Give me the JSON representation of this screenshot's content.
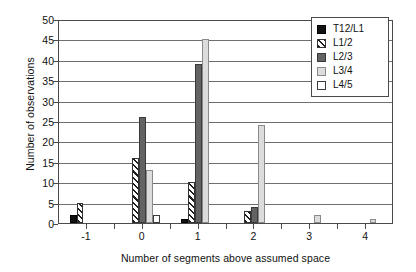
{
  "chart_data": {
    "type": "bar",
    "title": "",
    "xlabel": "Number of segments above assumed space",
    "ylabel": "Number of observations",
    "categories": [
      "-1",
      "0",
      "1",
      "2",
      "3",
      "4"
    ],
    "xlim": [
      -1.5,
      4.5
    ],
    "ylim": [
      0,
      50
    ],
    "yticks": [
      0,
      5,
      10,
      15,
      20,
      25,
      30,
      35,
      40,
      45,
      50
    ],
    "grid": true,
    "grid_axis": "y",
    "legend_position": "top-right",
    "series": [
      {
        "name": "T12/L1",
        "color": "#111111",
        "pattern": "solid",
        "values": [
          2,
          0,
          1,
          0,
          0,
          0
        ]
      },
      {
        "name": "L1/2",
        "color": "#ffffff",
        "pattern": "diagonal-hatch",
        "values": [
          5,
          16,
          10,
          3,
          0,
          0
        ]
      },
      {
        "name": "L2/3",
        "color": "#636363",
        "pattern": "solid",
        "values": [
          0,
          26,
          39,
          4,
          0,
          0
        ]
      },
      {
        "name": "L3/4",
        "color": "#dcdcdc",
        "pattern": "solid",
        "values": [
          0,
          13,
          45,
          24,
          2,
          1
        ]
      },
      {
        "name": "L4/5",
        "color": "#ffffff",
        "pattern": "solid",
        "values": [
          0,
          2,
          0,
          0,
          0,
          0
        ]
      }
    ]
  },
  "axes": {
    "y_tick_labels": [
      "0",
      "5",
      "10",
      "15",
      "20",
      "25",
      "30",
      "35",
      "40",
      "45",
      "50"
    ],
    "x_tick_labels": [
      "-1",
      "0",
      "1",
      "2",
      "3",
      "4"
    ],
    "y_title": "Number of observations",
    "x_title": "Number of segments above assumed space"
  },
  "legend": {
    "items": [
      {
        "label": "T12/L1"
      },
      {
        "label": "L1/2"
      },
      {
        "label": "L2/3"
      },
      {
        "label": "L3/4"
      },
      {
        "label": "L4/5"
      }
    ]
  }
}
